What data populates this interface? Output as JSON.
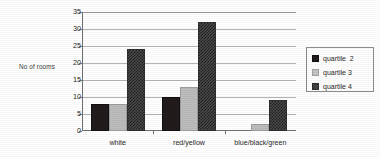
{
  "chart_data": {
    "type": "bar",
    "title": "",
    "xlabel": "",
    "ylabel": "No of rooms",
    "categories": [
      "white",
      "red/yellow",
      "blue/black/green"
    ],
    "series": [
      {
        "name": "quartile  2",
        "values": [
          8,
          10,
          0
        ]
      },
      {
        "name": "quartile 3",
        "values": [
          8,
          13,
          2
        ]
      },
      {
        "name": "quartile 4",
        "values": [
          24,
          32,
          9
        ]
      }
    ],
    "ylim": [
      0,
      35
    ],
    "yticks": [
      0,
      5,
      10,
      15,
      20,
      25,
      30,
      35
    ],
    "grid": true,
    "legend_position": "right"
  },
  "axis": {
    "y_title": "No of rooms",
    "ticks": [
      "35",
      "30",
      "25",
      "20",
      "15",
      "10",
      "5",
      "0"
    ]
  },
  "categories": [
    {
      "label": "white"
    },
    {
      "label": "red/yellow"
    },
    {
      "label": "blue/black/green"
    }
  ],
  "legend": {
    "entries": [
      {
        "label": "quartile  2",
        "swatch": "q2"
      },
      {
        "label": "quartile 3",
        "swatch": "q3"
      },
      {
        "label": "quartile 4",
        "swatch": "q4"
      }
    ]
  },
  "colors": {
    "quartile2": "#211b1c",
    "quartile3": "#bcbcbc",
    "quartile4": "#3a3a3a",
    "gridline": "#b4b4b4",
    "axis": "#6f6f6f"
  }
}
